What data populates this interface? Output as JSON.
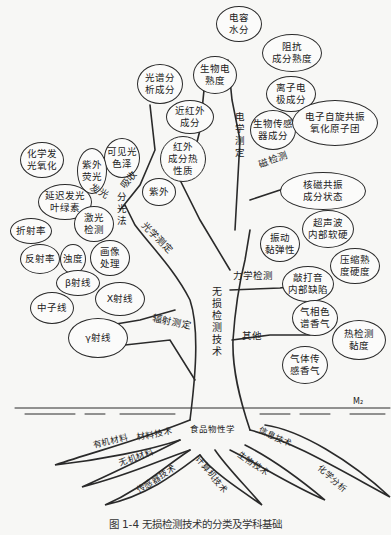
{
  "title": "无损检测技术",
  "caption": "图 1-4   无损检测技术的分类及学科基础",
  "branches": {
    "electrical": {
      "label": "电学测定",
      "items": [
        "电容\n水分",
        "生物电\n熟度",
        "阻抗\n成分熟度",
        "离子电\n极成分",
        "生物传感\n器成分"
      ]
    },
    "magnetic": {
      "label": "磁检测",
      "items": [
        "电子自旋共振\n氧化原子团",
        "核磁共振\n成分状态"
      ]
    },
    "optical": {
      "label": "光学测定",
      "sub_absorb": "吸收",
      "sub_emit": "发光",
      "sub_spectro": "分光法",
      "items": [
        "光谱分\n析成分",
        "近红外\n成分",
        "红外\n成分热\n性质",
        "紫外",
        "可见光\n色泽",
        "紫外\n荧光",
        "化学发\n光氧化",
        "延迟发光\n叶绿素",
        "激光\n检测",
        "折射率",
        "反射率",
        "浊度",
        "画像\n处理"
      ]
    },
    "radiation": {
      "label": "辐射测定",
      "items": [
        "β射线",
        "X射线",
        "中子线",
        "γ射线"
      ]
    },
    "mechanical": {
      "label": "力学检测",
      "items": [
        "振动\n黏弹性",
        "超声波\n内部软硬",
        "压缩熟\n度硬度",
        "敲打音\n内部缺陷"
      ]
    },
    "other": {
      "label": "其他",
      "items": [
        "气相色\n谱香气",
        "热检测\n黏度",
        "气体传\n感香气"
      ]
    }
  },
  "roots": [
    "有机材料",
    "材料技术",
    "无机材料",
    "传感器技术",
    "计算机技术",
    "食品物性学",
    "生物技术",
    "信息技术",
    "化学分析"
  ],
  "ground_mark": "M₂"
}
